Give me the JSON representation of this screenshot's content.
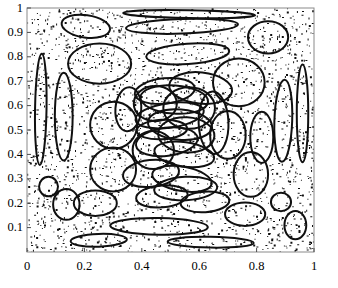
{
  "figure": {
    "title": "",
    "background_color": "#ffffff",
    "frame_color": "#808080",
    "point_color": "#101010",
    "ellipse_color": "#101010"
  },
  "chart_data": {
    "type": "scatter",
    "title": "",
    "xlabel": "",
    "ylabel": "",
    "xlim": [
      0,
      1
    ],
    "ylim": [
      0,
      1
    ],
    "grid": false,
    "legend": null,
    "xticks": [
      0,
      0.2,
      0.4,
      0.6,
      0.8,
      1
    ],
    "xtick_labels": [
      "0",
      "0.2",
      "0.4",
      "0.6",
      "0.8",
      "1"
    ],
    "yticks": [
      0.1,
      0.2,
      0.3,
      0.4,
      0.5,
      0.6,
      0.7,
      0.8,
      0.9,
      1
    ],
    "ytick_labels": [
      "0.1",
      "0.2",
      "0.3",
      "0.4",
      "0.5",
      "0.6",
      "0.7",
      "0.8",
      "0.9",
      "1"
    ],
    "series": [
      {
        "name": "uniform-random-points",
        "type": "scatter",
        "marker": "pixel",
        "color": "#101010",
        "n_points": 2600,
        "x_range": [
          0,
          1
        ],
        "y_range": [
          0,
          1
        ],
        "distribution": "uniform"
      },
      {
        "name": "ellipses",
        "type": "ellipse-overlay",
        "color": "#101010",
        "line_width": 2,
        "count": 44,
        "ellipses": [
          {
            "cx": 0.565,
            "cy": 0.975,
            "rx": 0.23,
            "ry": 0.016,
            "angle": -1
          },
          {
            "cx": 0.54,
            "cy": 0.925,
            "rx": 0.195,
            "ry": 0.03,
            "angle": 2
          },
          {
            "cx": 0.205,
            "cy": 0.925,
            "rx": 0.085,
            "ry": 0.046,
            "angle": -8
          },
          {
            "cx": 0.84,
            "cy": 0.88,
            "rx": 0.07,
            "ry": 0.066,
            "angle": 0
          },
          {
            "cx": 0.56,
            "cy": 0.812,
            "rx": 0.145,
            "ry": 0.042,
            "angle": 4
          },
          {
            "cx": 0.253,
            "cy": 0.772,
            "rx": 0.11,
            "ry": 0.082,
            "angle": 0
          },
          {
            "cx": 0.048,
            "cy": 0.585,
            "rx": 0.02,
            "ry": 0.228,
            "angle": -1
          },
          {
            "cx": 0.128,
            "cy": 0.555,
            "rx": 0.031,
            "ry": 0.18,
            "angle": 0
          },
          {
            "cx": 0.96,
            "cy": 0.568,
            "rx": 0.02,
            "ry": 0.2,
            "angle": 0
          },
          {
            "cx": 0.893,
            "cy": 0.538,
            "rx": 0.031,
            "ry": 0.168,
            "angle": -2
          },
          {
            "cx": 0.738,
            "cy": 0.695,
            "rx": 0.09,
            "ry": 0.098,
            "angle": 0
          },
          {
            "cx": 0.605,
            "cy": 0.672,
            "rx": 0.11,
            "ry": 0.064,
            "angle": -6
          },
          {
            "cx": 0.48,
            "cy": 0.66,
            "rx": 0.105,
            "ry": 0.052,
            "angle": 6
          },
          {
            "cx": 0.513,
            "cy": 0.625,
            "rx": 0.118,
            "ry": 0.058,
            "angle": -4
          },
          {
            "cx": 0.447,
            "cy": 0.608,
            "rx": 0.075,
            "ry": 0.072,
            "angle": 0
          },
          {
            "cx": 0.565,
            "cy": 0.59,
            "rx": 0.09,
            "ry": 0.085,
            "angle": 0
          },
          {
            "cx": 0.497,
            "cy": 0.56,
            "rx": 0.12,
            "ry": 0.05,
            "angle": 8
          },
          {
            "cx": 0.533,
            "cy": 0.522,
            "rx": 0.112,
            "ry": 0.062,
            "angle": -5
          },
          {
            "cx": 0.47,
            "cy": 0.502,
            "rx": 0.088,
            "ry": 0.04,
            "angle": 3
          },
          {
            "cx": 0.555,
            "cy": 0.48,
            "rx": 0.098,
            "ry": 0.072,
            "angle": -3
          },
          {
            "cx": 0.487,
            "cy": 0.452,
            "rx": 0.108,
            "ry": 0.058,
            "angle": 7
          },
          {
            "cx": 0.44,
            "cy": 0.418,
            "rx": 0.072,
            "ry": 0.078,
            "angle": 0
          },
          {
            "cx": 0.548,
            "cy": 0.4,
            "rx": 0.105,
            "ry": 0.05,
            "angle": -8
          },
          {
            "cx": 0.302,
            "cy": 0.52,
            "rx": 0.082,
            "ry": 0.096,
            "angle": 0
          },
          {
            "cx": 0.7,
            "cy": 0.48,
            "rx": 0.062,
            "ry": 0.098,
            "angle": 0
          },
          {
            "cx": 0.818,
            "cy": 0.47,
            "rx": 0.04,
            "ry": 0.105,
            "angle": 0
          },
          {
            "cx": 0.65,
            "cy": 0.53,
            "rx": 0.052,
            "ry": 0.128,
            "angle": 2
          },
          {
            "cx": 0.3,
            "cy": 0.338,
            "rx": 0.08,
            "ry": 0.09,
            "angle": 0
          },
          {
            "cx": 0.432,
            "cy": 0.322,
            "rx": 0.098,
            "ry": 0.055,
            "angle": 6
          },
          {
            "cx": 0.54,
            "cy": 0.3,
            "rx": 0.105,
            "ry": 0.05,
            "angle": -10
          },
          {
            "cx": 0.553,
            "cy": 0.26,
            "rx": 0.11,
            "ry": 0.048,
            "angle": 3
          },
          {
            "cx": 0.47,
            "cy": 0.228,
            "rx": 0.09,
            "ry": 0.045,
            "angle": 5
          },
          {
            "cx": 0.78,
            "cy": 0.318,
            "rx": 0.06,
            "ry": 0.092,
            "angle": 0
          },
          {
            "cx": 0.137,
            "cy": 0.195,
            "rx": 0.046,
            "ry": 0.063,
            "angle": 0
          },
          {
            "cx": 0.238,
            "cy": 0.2,
            "rx": 0.075,
            "ry": 0.052,
            "angle": 0
          },
          {
            "cx": 0.76,
            "cy": 0.155,
            "rx": 0.07,
            "ry": 0.048,
            "angle": 0
          },
          {
            "cx": 0.935,
            "cy": 0.11,
            "rx": 0.038,
            "ry": 0.058,
            "angle": 0
          },
          {
            "cx": 0.46,
            "cy": 0.105,
            "rx": 0.17,
            "ry": 0.034,
            "angle": -1
          },
          {
            "cx": 0.25,
            "cy": 0.048,
            "rx": 0.098,
            "ry": 0.026,
            "angle": 2
          },
          {
            "cx": 0.64,
            "cy": 0.04,
            "rx": 0.15,
            "ry": 0.022,
            "angle": -1
          },
          {
            "cx": 0.075,
            "cy": 0.268,
            "rx": 0.033,
            "ry": 0.04,
            "angle": 0
          },
          {
            "cx": 0.353,
            "cy": 0.585,
            "rx": 0.045,
            "ry": 0.09,
            "angle": -4
          },
          {
            "cx": 0.62,
            "cy": 0.205,
            "rx": 0.085,
            "ry": 0.042,
            "angle": 4
          },
          {
            "cx": 0.885,
            "cy": 0.205,
            "rx": 0.035,
            "ry": 0.038,
            "angle": 0
          }
        ]
      }
    ]
  }
}
